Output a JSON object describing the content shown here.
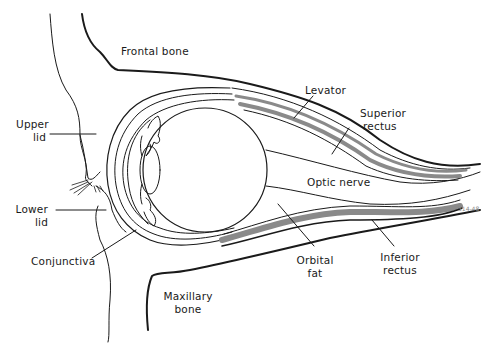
{
  "diagram": {
    "type": "anatomical-cross-section",
    "signature": "314-48",
    "colors": {
      "line": "#1a1a1a",
      "muscle_shade": "#8a8a8a",
      "background": "#ffffff"
    },
    "labels": {
      "frontal_bone": "Frontal bone",
      "levator": "Levator",
      "superior_rectus": {
        "line1": "Superior",
        "line2": "rectus"
      },
      "upper_lid": {
        "line1": "Upper",
        "line2": "lid"
      },
      "optic_nerve": "Optic nerve",
      "lower_lid": {
        "line1": "Lower",
        "line2": "lid"
      },
      "conjunctiva": "Conjunctiva",
      "orbital_fat": {
        "line1": "Orbital",
        "line2": "fat"
      },
      "inferior_rectus": {
        "line1": "Inferior",
        "line2": "rectus"
      },
      "maxillary_bone": {
        "line1": "Maxillary",
        "line2": "bone"
      }
    }
  }
}
